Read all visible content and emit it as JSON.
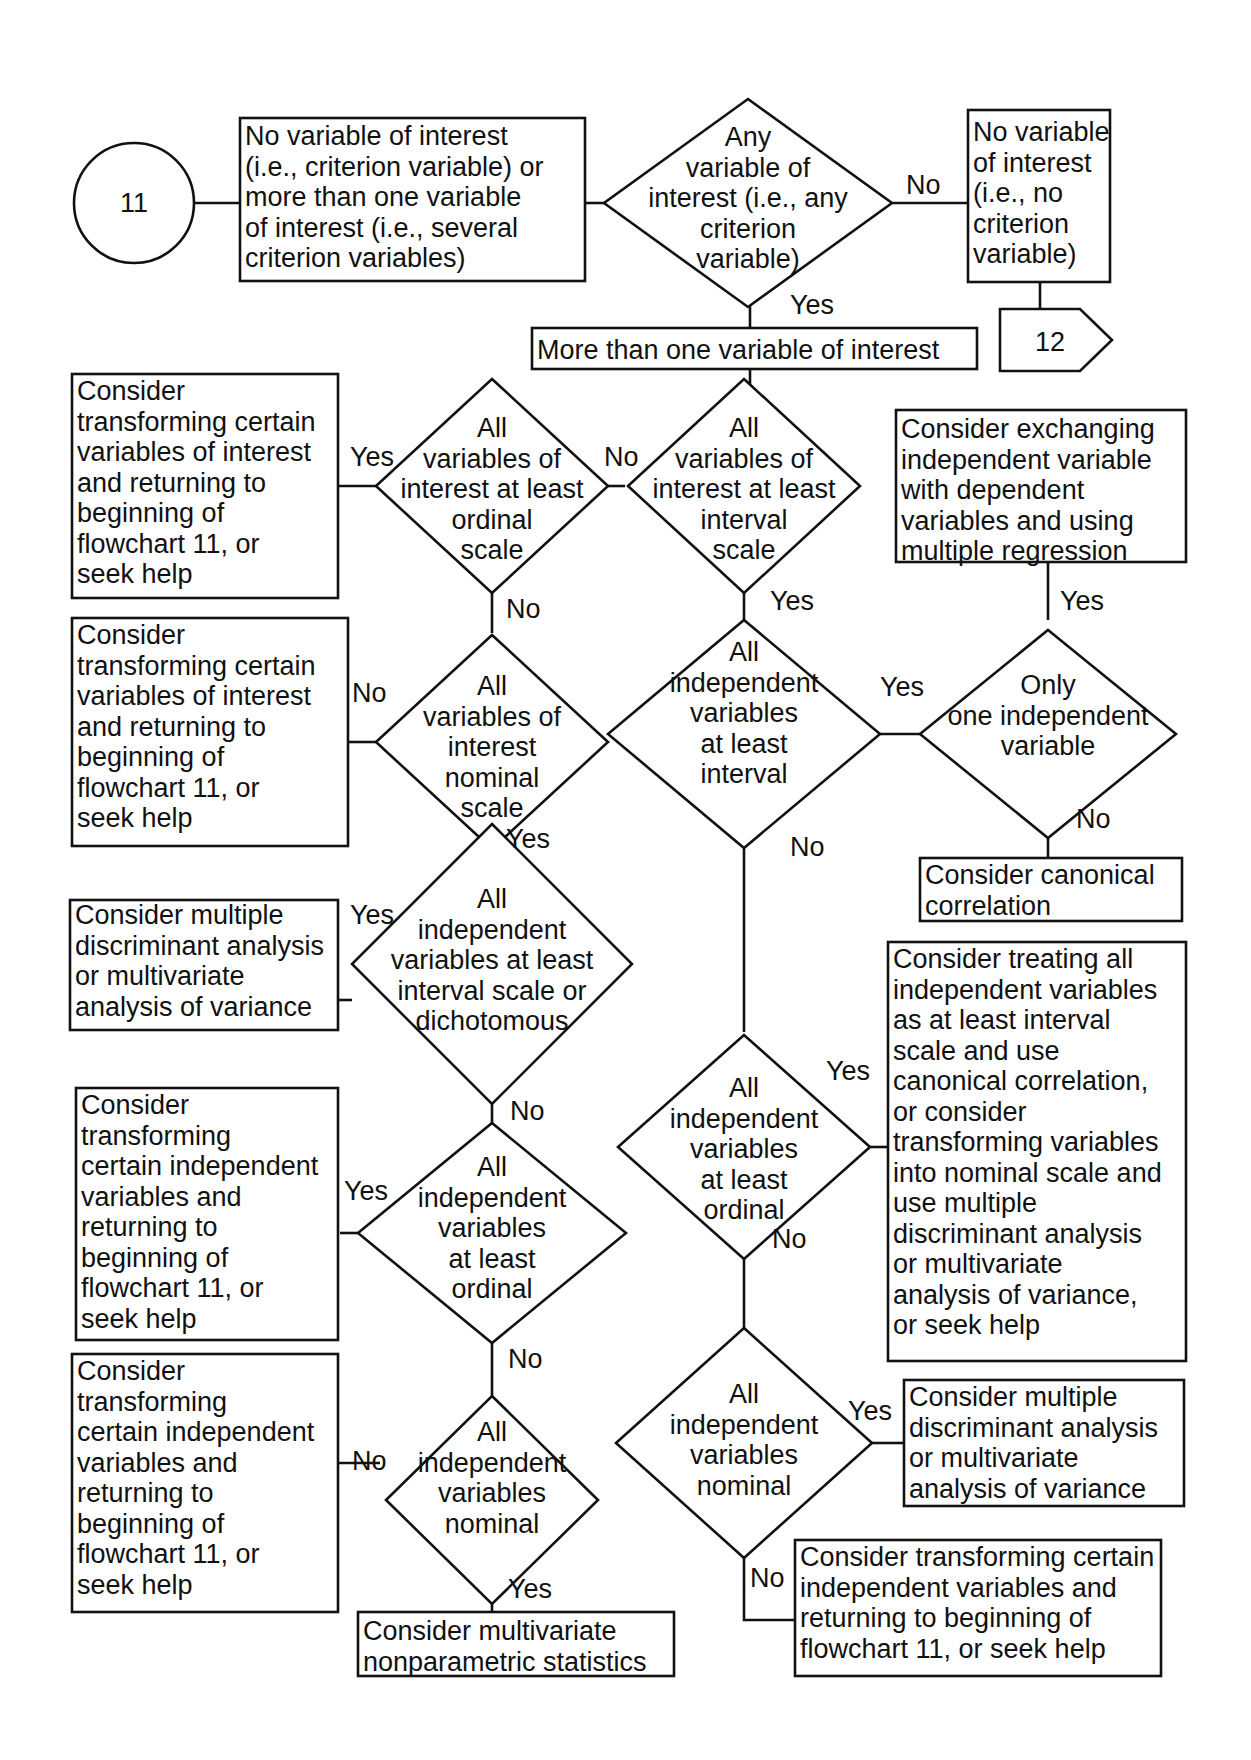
{
  "colors": {
    "stroke": "#111111",
    "background": "#ffffff"
  },
  "connectors": {
    "start": {
      "label": "11",
      "shape": "circle"
    },
    "end": {
      "label": "12",
      "shape": "off-page-arrow"
    }
  },
  "boxes": {
    "b_top_left": [
      "No variable of interest",
      "(i.e., criterion variable) or",
      "more than one variable",
      "of interest (i.e., several",
      "criterion variables)"
    ],
    "b_no_interest": [
      "No variable",
      "of interest",
      "(i.e., no",
      "criterion",
      "variable)"
    ],
    "b_more_than_one": [
      "More than one variable of interest"
    ],
    "b_transform_1": [
      "Consider",
      "transforming certain",
      "variables of interest",
      "and returning to",
      "beginning of",
      "flowchart 11, or",
      "seek help"
    ],
    "b_exchange": [
      "Consider exchanging",
      "independent variable",
      "with dependent",
      "variables and using",
      "multiple regression"
    ],
    "b_transform_2": [
      "Consider",
      "transforming certain",
      "variables of interest",
      "and returning to",
      "beginning of",
      "flowchart 11, or",
      "seek help"
    ],
    "b_canonical": [
      "Consider canonical",
      "correlation"
    ],
    "b_mda_1": [
      "Consider multiple",
      "discriminant analysis",
      "or multivariate",
      "analysis of variance"
    ],
    "b_treating": [
      "Consider treating all",
      "independent variables",
      "as at least interval",
      "scale and use",
      "canonical correlation,",
      "or consider",
      "transforming variables",
      "into nominal scale and",
      "use multiple",
      "discriminant analysis",
      "or multivariate",
      "analysis of variance,",
      "or seek help"
    ],
    "b_transform_3": [
      "Consider",
      "transforming",
      "certain independent",
      "variables and",
      "returning to",
      "beginning of",
      "flowchart 11, or",
      "seek help"
    ],
    "b_transform_4": [
      "Consider",
      "transforming",
      "certain independent",
      "variables and",
      "returning to",
      "beginning of",
      "flowchart 11, or",
      "seek help"
    ],
    "b_mda_2": [
      "Consider multiple",
      "discriminant analysis",
      "or multivariate",
      "analysis of variance"
    ],
    "b_nonparam": [
      "Consider multivariate",
      "nonparametric statistics"
    ],
    "b_transform_5": [
      "Consider transforming certain",
      "independent variables and",
      "returning to beginning of",
      "flowchart 11, or seek help"
    ]
  },
  "decisions": {
    "d_any": [
      "Any",
      "variable of",
      "interest (i.e., any",
      "criterion",
      "variable)"
    ],
    "d_ordinal": [
      "All",
      "variables of",
      "interest at least",
      "ordinal",
      "scale"
    ],
    "d_interval": [
      "All",
      "variables of",
      "interest at least",
      "interval",
      "scale"
    ],
    "d_nominal": [
      "All",
      "variables of",
      "interest",
      "nominal",
      "scale"
    ],
    "d_iv_interval": [
      "All",
      "independent",
      "variables",
      "at least",
      "interval"
    ],
    "d_only_one": [
      "Only",
      "one independent",
      "variable"
    ],
    "d_iv_interval_dich": [
      "All",
      "independent",
      "variables at least",
      "interval scale or",
      "dichotomous"
    ],
    "d_iv_ordinal_right": [
      "All",
      "independent",
      "variables",
      "at least",
      "ordinal"
    ],
    "d_iv_ordinal_left": [
      "All",
      "independent",
      "variables",
      "at least",
      "ordinal"
    ],
    "d_iv_nominal_right": [
      "All",
      "independent",
      "variables",
      "nominal"
    ],
    "d_iv_nominal_left": [
      "All",
      "independent",
      "variables",
      "nominal"
    ]
  },
  "edge_labels": {
    "any_no": "No",
    "any_yes": "Yes",
    "ordinal_yes": "Yes",
    "ordinal_no_to_interval": "No",
    "ordinal_no_down": "No",
    "interval_yes": "Yes",
    "exchange_yes": "Yes",
    "nominal_no": "No",
    "iv_interval_yes": "Yes",
    "only_one_no": "No",
    "nominal_yes": "Yes",
    "iv_interval_no": "No",
    "dich_yes": "Yes",
    "dich_no": "No",
    "iv_ord_right_yes": "Yes",
    "iv_ord_left_yes": "Yes",
    "iv_ord_right_no": "No",
    "iv_ord_left_no": "No",
    "iv_nom_right_yes": "Yes",
    "iv_nom_left_no": "No",
    "iv_nom_left_yes": "Yes",
    "iv_nom_right_no": "No"
  }
}
